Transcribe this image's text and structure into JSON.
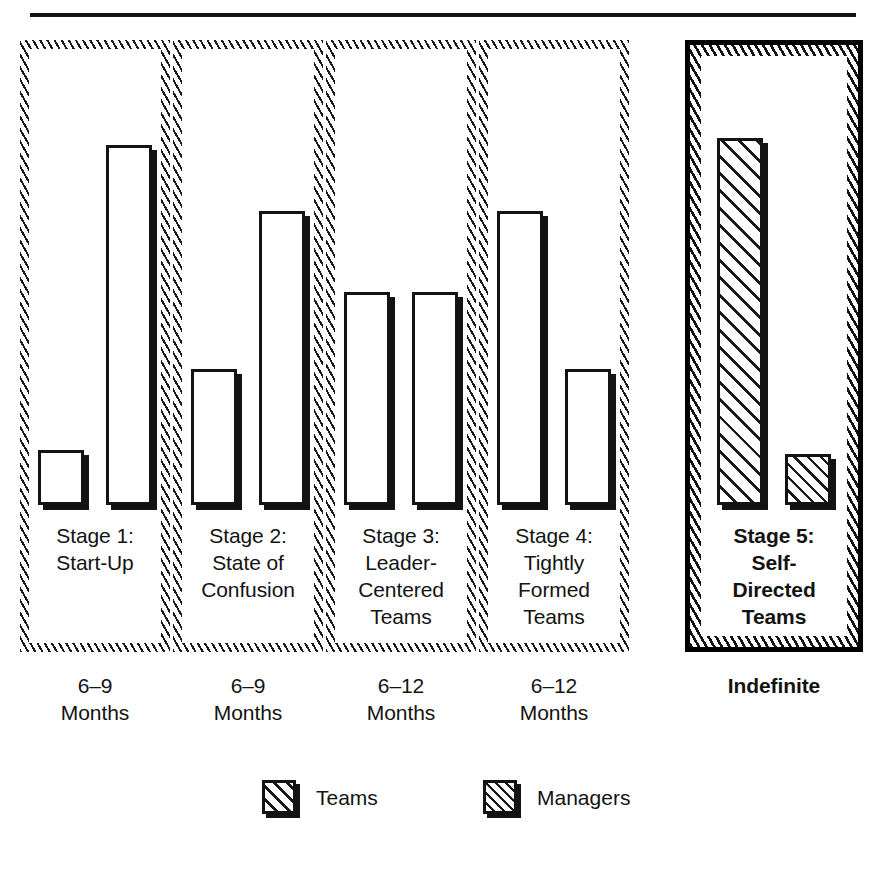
{
  "figure": {
    "top_rule": true,
    "background_color": "#ffffff",
    "ink_color": "#131313"
  },
  "chart_data": {
    "type": "bar",
    "title": "",
    "subtitle": "",
    "xlabel": "",
    "ylabel": "",
    "grid": false,
    "axis_visible": false,
    "value_unit": "relative height (percent of tallest bar)",
    "ylim": [
      0,
      100
    ],
    "legend_position": "bottom-center",
    "categories": [
      "Stage 1:\nStart-Up",
      "Stage 2:\nState of\nConfusion",
      "Stage 3:\nLeader-\nCentered\nTeams",
      "Stage 4:\nTightly\nFormed\nTeams",
      "Stage 5:\nSelf-\nDirected\nTeams"
    ],
    "series": [
      {
        "name": "Teams",
        "values": [
          15,
          37,
          58,
          80,
          100
        ]
      },
      {
        "name": "Managers",
        "values": [
          98,
          80,
          58,
          37,
          14
        ]
      }
    ],
    "annotations": [
      "6–9\nMonths",
      "6–9\nMonths",
      "6–12\nMonths",
      "6–12\nMonths",
      "Indefinite"
    ],
    "highlighted_category_index": 4
  },
  "panels": [
    {
      "id": "stage-1",
      "caption": "Stage 1:\nStart-Up",
      "duration": "6–9\nMonths",
      "emphasis": false,
      "bars": [
        {
          "series": "Teams",
          "pattern": "solid",
          "height_pct": 15
        },
        {
          "series": "Managers",
          "pattern": "solid",
          "height_pct": 98
        }
      ]
    },
    {
      "id": "stage-2",
      "caption": "Stage 2:\nState of\nConfusion",
      "duration": "6–9\nMonths",
      "emphasis": false,
      "bars": [
        {
          "series": "Teams",
          "pattern": "solid",
          "height_pct": 37
        },
        {
          "series": "Managers",
          "pattern": "solid",
          "height_pct": 80
        }
      ]
    },
    {
      "id": "stage-3",
      "caption": "Stage 3:\nLeader-\nCentered\nTeams",
      "duration": "6–12\nMonths",
      "emphasis": false,
      "bars": [
        {
          "series": "Teams",
          "pattern": "solid",
          "height_pct": 58
        },
        {
          "series": "Managers",
          "pattern": "solid",
          "height_pct": 58
        }
      ]
    },
    {
      "id": "stage-4",
      "caption": "Stage 4:\nTightly\nFormed\nTeams",
      "duration": "6–12\nMonths",
      "emphasis": false,
      "bars": [
        {
          "series": "Teams",
          "pattern": "solid",
          "height_pct": 80
        },
        {
          "series": "Managers",
          "pattern": "solid",
          "height_pct": 37
        }
      ]
    },
    {
      "id": "stage-5",
      "caption": "Stage 5:\nSelf-\nDirected\nTeams",
      "duration": "Indefinite",
      "emphasis": true,
      "bars": [
        {
          "series": "Teams",
          "pattern": "hatch-coarse",
          "height_pct": 100
        },
        {
          "series": "Managers",
          "pattern": "hatch-fine",
          "height_pct": 14
        }
      ]
    }
  ],
  "legend": {
    "items": [
      {
        "label": "Teams",
        "pattern": "hatch-coarse"
      },
      {
        "label": "Managers",
        "pattern": "hatch-fine"
      }
    ]
  }
}
